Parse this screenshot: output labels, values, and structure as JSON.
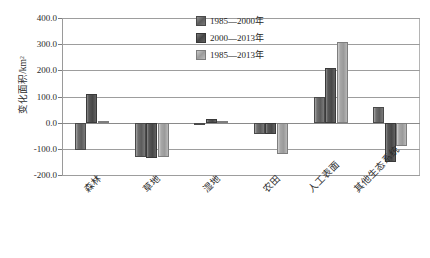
{
  "chart_data": {
    "type": "bar",
    "title": "",
    "xlabel": "",
    "ylabel": "变化面积/km²",
    "ylim": [
      -200,
      400
    ],
    "ytick_labels": [
      "400.0",
      "300.0",
      "200.0",
      "100.0",
      "0.0",
      "-100.0",
      "-200.0"
    ],
    "ytick_values": [
      400,
      300,
      200,
      100,
      0,
      -100,
      -200
    ],
    "grid": true,
    "legend_position": "top-center",
    "categories": [
      "森林",
      "草地",
      "湿地",
      "农田",
      "人工表面",
      "其他生态系统"
    ],
    "series": [
      {
        "name": "1985—2000年",
        "color": "#5c5c5c",
        "values": [
          -105,
          -133,
          -3,
          -42,
          98,
          58
        ]
      },
      {
        "name": "2000—2013年",
        "color": "#474747",
        "values": [
          110,
          -135,
          13,
          -45,
          210,
          -150
        ]
      },
      {
        "name": "1985—2013年",
        "color": "#9a9a9a",
        "values": [
          7,
          -133,
          8,
          -120,
          308,
          -90
        ]
      }
    ]
  }
}
